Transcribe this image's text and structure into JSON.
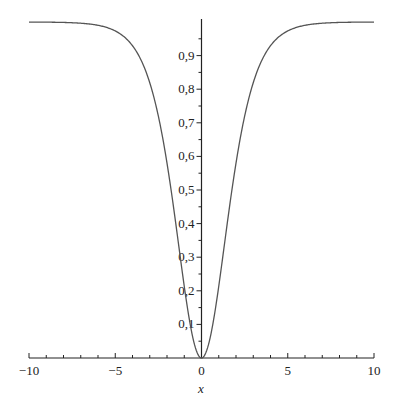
{
  "chart_data": {
    "type": "line",
    "title": "",
    "xlabel": "x",
    "ylabel": "",
    "xlim": [
      -10,
      10
    ],
    "ylim": [
      0,
      1
    ],
    "grid": false,
    "legend": null,
    "function": "tanh(x/2)^2",
    "x_ticks": [
      -10,
      -5,
      0,
      5,
      10
    ],
    "x_tick_labels": [
      "−10",
      "−5",
      "0",
      "5",
      "10"
    ],
    "y_ticks": [
      0.1,
      0.2,
      0.3,
      0.4,
      0.5,
      0.6,
      0.7,
      0.8,
      0.9
    ],
    "y_tick_labels": [
      "0,1",
      "0,2",
      "0,3",
      "0,4",
      "0,5",
      "0,6",
      "0,7",
      "0,8",
      "0,9"
    ],
    "series": [
      {
        "name": "f(x)",
        "color": "#555555",
        "x": [
          -10,
          -8,
          -6,
          -5,
          -4,
          -3,
          -2.5,
          -2,
          -1.5,
          -1,
          -0.5,
          0,
          0.5,
          1,
          1.5,
          2,
          2.5,
          3,
          4,
          5,
          6,
          8,
          10
        ],
        "y": [
          1.0,
          0.999,
          0.99,
          0.973,
          0.929,
          0.822,
          0.726,
          0.58,
          0.403,
          0.213,
          0.061,
          0.0,
          0.061,
          0.213,
          0.403,
          0.58,
          0.726,
          0.822,
          0.929,
          0.973,
          0.99,
          0.999,
          1.0
        ]
      }
    ]
  }
}
